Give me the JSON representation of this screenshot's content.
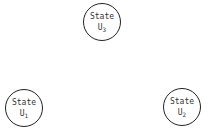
{
  "diagram": {
    "nodes": [
      {
        "id": "u3",
        "label": "State",
        "var": "U",
        "sub": "3"
      },
      {
        "id": "u1",
        "label": "State",
        "var": "U",
        "sub": "1"
      },
      {
        "id": "u2",
        "label": "State",
        "var": "U",
        "sub": "2"
      }
    ]
  }
}
